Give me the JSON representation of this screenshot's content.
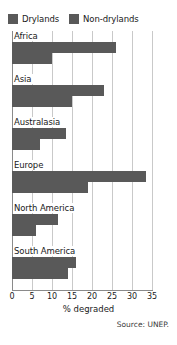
{
  "legend": {
    "position": "top-left",
    "entries": [
      {
        "label": "Drylands",
        "color": "#595959",
        "icon": "legend-swatch-icon"
      },
      {
        "label": "Non-drylands",
        "color": "#595959",
        "icon": "legend-swatch-icon"
      }
    ]
  },
  "axis": {
    "ticks": [
      0,
      5,
      10,
      15,
      20,
      25,
      30,
      35
    ],
    "xlabel": "% degraded",
    "xlim": [
      0,
      35
    ]
  },
  "source": "Source: UNEP.",
  "groups": [
    {
      "label": "Africa",
      "drylands": 26,
      "nondrylands": 10
    },
    {
      "label": "Asia",
      "drylands": 23,
      "nondrylands": 15
    },
    {
      "label": "Australasia",
      "drylands": 13.5,
      "nondrylands": 7
    },
    {
      "label": "Europe",
      "drylands": 33.5,
      "nondrylands": 19
    },
    {
      "label": "North America",
      "drylands": 11.5,
      "nondrylands": 6
    },
    {
      "label": "South America",
      "drylands": 16,
      "nondrylands": 14
    }
  ],
  "chart_data": {
    "type": "bar",
    "orientation": "horizontal",
    "title": "",
    "subtitle": "",
    "xlabel": "% degraded",
    "ylabel": "",
    "xlim": [
      0,
      35
    ],
    "xticks": [
      0,
      5,
      10,
      15,
      20,
      25,
      30,
      35
    ],
    "grid": "vertical",
    "legend_position": "top-left",
    "categories": [
      "Africa",
      "Asia",
      "Australasia",
      "Europe",
      "North America",
      "South America"
    ],
    "series": [
      {
        "name": "Drylands",
        "color": "#595959",
        "values": [
          26,
          23,
          13.5,
          33.5,
          11.5,
          16
        ]
      },
      {
        "name": "Non-drylands",
        "color": "#595959",
        "values": [
          10,
          15,
          7,
          19,
          6,
          14
        ]
      }
    ],
    "annotations": [
      "Source: UNEP."
    ]
  }
}
